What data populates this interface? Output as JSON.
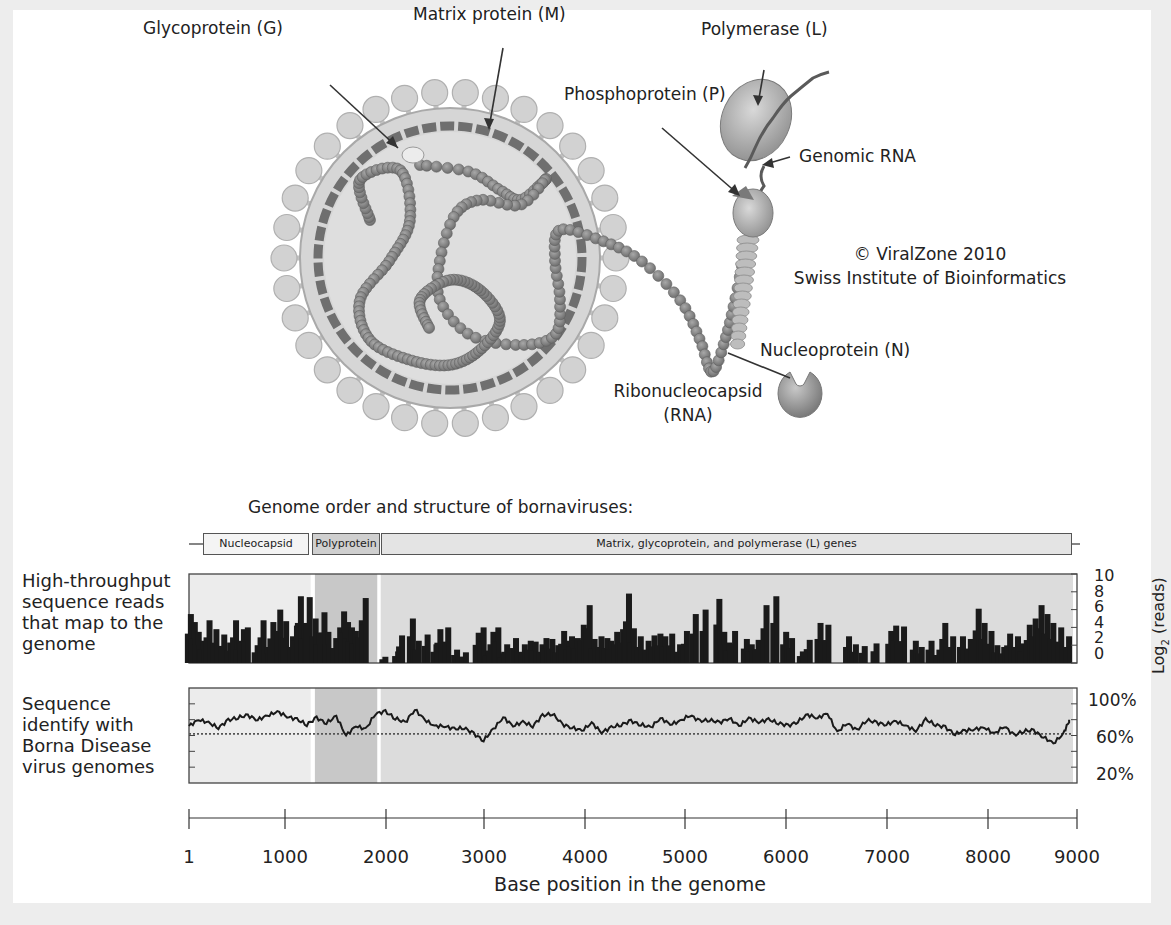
{
  "virion_diagram": {
    "labels": {
      "glycoprotein": "Glycoprotein (G)",
      "matrix": "Matrix protein (M)",
      "polymerase": "Polymerase (L)",
      "phosphoprotein": "Phosphoprotein (P)",
      "genomic_rna": "Genomic RNA",
      "nucleoprotein": "Nucleoprotein (N)",
      "ribonucleocapsid_line1": "Ribonucleocapsid",
      "ribonucleocapsid_line2": "(RNA)"
    },
    "credit_line1": "© ViralZone 2010",
    "credit_line2": "Swiss Institute of Bioinformatics"
  },
  "genome": {
    "title": "Genome order and structure of bornaviruses:",
    "genes": [
      {
        "label": "Nucleocapsid",
        "start": 130,
        "end": 1250,
        "color": "#f4f4f4"
      },
      {
        "label": "Polyprotein",
        "start": 1260,
        "end": 1940,
        "color": "#cfcfcf"
      },
      {
        "label": "Matrix, glycoprotein, and polymerase (L) genes",
        "start": 1950,
        "end": 8950,
        "color": "#e4e4e4"
      }
    ]
  },
  "chart_data": [
    {
      "type": "bar",
      "title": "High-throughput sequence reads that map to the genome",
      "left_label_lines": [
        "High-throughput",
        "sequence reads",
        "that map to the",
        "genome"
      ],
      "xlabel": "Base position in the genome",
      "ylabel": "Log2 (reads)",
      "ylabel_main": "Log",
      "ylabel_sub": "2",
      "ylabel_suffix": "(reads)",
      "xlim": [
        1,
        9000
      ],
      "ylim": [
        0,
        10
      ],
      "yticks": [
        0,
        2,
        4,
        6,
        8,
        10
      ],
      "shaded_regions": [
        {
          "name": "Nucleocapsid",
          "start": 1,
          "end": 1250,
          "color": "#ececec"
        },
        {
          "name": "Polyprotein",
          "start": 1280,
          "end": 1920,
          "color": "#c8c8c8"
        },
        {
          "name": "Matrix, glycoprotein, and polymerase (L) genes",
          "start": 1950,
          "end": 9000,
          "color": "#dcdcdc"
        }
      ],
      "x": [
        20,
        60,
        100,
        150,
        210,
        280,
        360,
        420,
        480,
        520,
        560,
        600,
        700,
        760,
        800,
        860,
        930,
        990,
        1060,
        1100,
        1140,
        1180,
        1230,
        1290,
        1330,
        1380,
        1420,
        1500,
        1540,
        1580,
        1620,
        1660,
        1700,
        1760,
        1800,
        2000,
        2130,
        2170,
        2280,
        2340,
        2430,
        2520,
        2560,
        2640,
        2730,
        2820,
        2950,
        3000,
        3050,
        3100,
        3150,
        3200,
        3240,
        3330,
        3420,
        3480,
        3530,
        3600,
        3640,
        3700,
        3760,
        3820,
        3870,
        3900,
        3960,
        4020,
        4080,
        4130,
        4200,
        4260,
        4300,
        4360,
        4420,
        4480,
        4530,
        4600,
        4680,
        4740,
        4800,
        4850,
        4920,
        5000,
        5070,
        5160,
        5260,
        5400,
        5450,
        5500,
        5560,
        5680,
        5730,
        5800,
        5880,
        5980,
        6080,
        6140,
        6250,
        6320,
        6430,
        6510,
        6720,
        6790,
        6880,
        7000,
        7150,
        7200,
        7280,
        7400,
        7460,
        7560,
        7640,
        7700,
        7780,
        7880,
        7960,
        8040,
        8100,
        8170,
        8230,
        8300,
        8360,
        8440,
        8500,
        8560,
        8620,
        8680,
        8740,
        8800,
        8880,
        8960
      ],
      "values": [
        5.5,
        4.6,
        3.5,
        2.5,
        4.8,
        3.8,
        3.2,
        2.3,
        4.8,
        2.5,
        3.8,
        4.0,
        2.0,
        4.8,
        1.8,
        4.6,
        6.0,
        4.7,
        3.0,
        4.2,
        7.5,
        4.5,
        7.4,
        5.0,
        3.4,
        5.7,
        3.5,
        2.8,
        4.0,
        5.8,
        4.6,
        4.0,
        3.6,
        4.8,
        7.3,
        0.7,
        1.3,
        3.1,
        5.0,
        2.5,
        3.2,
        2.1,
        3.8,
        4.0,
        1.5,
        1.2,
        3.4,
        4.0,
        1.4,
        3.5,
        4.0,
        1.1,
        2.1,
        2.8,
        2.1,
        2.5,
        2.4,
        2.1,
        2.8,
        2.7,
        2.0,
        3.6,
        2.5,
        3.0,
        2.8,
        4.3,
        6.5,
        2.7,
        3.0,
        2.8,
        2.5,
        3.5,
        3.8,
        7.8,
        3.9,
        3.0,
        2.5,
        3.1,
        3.3,
        3.0,
        3.3,
        2.1,
        3.6,
        5.5,
        6.0,
        7.2,
        3.5,
        2.3,
        3.6,
        2.7,
        2.1,
        2.6,
        6.5,
        7.5,
        3.5,
        2.8,
        1.3,
        2.6,
        4.5,
        4.3,
        3.0,
        2.1,
        1.9,
        2.2,
        3.6,
        4.2,
        4.1,
        2.5,
        1.8,
        2.5,
        1.5,
        4.5,
        3.0,
        3.0,
        2.7,
        6.1,
        4.5,
        3.6,
        2.0,
        1.8,
        3.3,
        3.0,
        2.2,
        4.3,
        5.0,
        6.5,
        5.5,
        4.5,
        4.0,
        3.0,
        2.0
      ],
      "grid": false
    },
    {
      "type": "line",
      "title": "Sequence identify with Borna Disease virus genomes",
      "left_label_lines": [
        "Sequence",
        "identify with",
        "Borna Disease",
        "virus genomes"
      ],
      "xlabel": "Base position in the genome",
      "ylabel": "Sequence identity (%)",
      "xlim": [
        1,
        9000
      ],
      "ylim": [
        0,
        120
      ],
      "yticks": [
        20,
        60,
        100
      ],
      "ytick_labels": [
        "20%",
        "60%",
        "100%"
      ],
      "reference_line": {
        "y": 62,
        "style": "dotted"
      },
      "shaded_regions": [
        {
          "name": "Nucleocapsid",
          "start": 1,
          "end": 1250,
          "color": "#ececec"
        },
        {
          "name": "Polyprotein",
          "start": 1280,
          "end": 1920,
          "color": "#c8c8c8"
        },
        {
          "name": "Matrix, glycoprotein, and polymerase (L) genes",
          "start": 1950,
          "end": 9000,
          "color": "#dcdcdc"
        }
      ],
      "x": [
        1,
        100,
        200,
        300,
        400,
        500,
        600,
        700,
        800,
        900,
        1000,
        1100,
        1200,
        1300,
        1400,
        1500,
        1600,
        1700,
        1800,
        1900,
        2000,
        2100,
        2200,
        2300,
        2400,
        2500,
        2600,
        2700,
        2800,
        2900,
        3000,
        3100,
        3200,
        3300,
        3400,
        3500,
        3600,
        3700,
        3800,
        3900,
        4000,
        4100,
        4200,
        4300,
        4400,
        4500,
        4600,
        4700,
        4800,
        4900,
        5000,
        5100,
        5200,
        5300,
        5400,
        5500,
        5600,
        5700,
        5800,
        5900,
        6000,
        6100,
        6200,
        6300,
        6400,
        6500,
        6600,
        6700,
        6800,
        6900,
        7000,
        7100,
        7200,
        7300,
        7400,
        7500,
        7600,
        7700,
        7800,
        7900,
        8000,
        8100,
        8200,
        8300,
        8400,
        8500,
        8600,
        8700,
        8800,
        8900,
        8960
      ],
      "values": [
        72,
        80,
        76,
        70,
        79,
        83,
        85,
        80,
        85,
        90,
        84,
        80,
        74,
        82,
        76,
        84,
        60,
        72,
        68,
        88,
        90,
        82,
        76,
        93,
        80,
        72,
        72,
        68,
        70,
        62,
        54,
        68,
        83,
        72,
        77,
        72,
        85,
        88,
        74,
        70,
        66,
        76,
        64,
        70,
        74,
        78,
        74,
        70,
        82,
        74,
        78,
        86,
        78,
        80,
        76,
        82,
        72,
        82,
        77,
        80,
        76,
        72,
        78,
        86,
        82,
        88,
        64,
        76,
        66,
        80,
        76,
        74,
        78,
        72,
        66,
        80,
        74,
        70,
        62,
        66,
        68,
        70,
        62,
        72,
        60,
        66,
        66,
        58,
        50,
        62,
        78
      ],
      "grid": false
    }
  ],
  "x_axis": {
    "ticks": [
      1,
      1000,
      2000,
      3000,
      4000,
      5000,
      6000,
      7000,
      8000,
      9000
    ],
    "tick_labels": [
      "1",
      "1000",
      "2000",
      "3000",
      "4000",
      "5000",
      "6000",
      "7000",
      "8000",
      "9000"
    ],
    "label": "Base position in the genome"
  },
  "reads_yticks_labels": [
    "10",
    "8",
    "6",
    "4",
    "2",
    "0"
  ]
}
